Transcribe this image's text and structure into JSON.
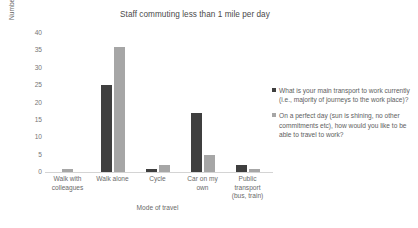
{
  "chart_data": {
    "type": "bar",
    "title": "Staff commuting less than 1 mile per day",
    "xlabel": "Mode of travel",
    "ylabel": "Number of staff",
    "ylim": [
      0,
      40
    ],
    "yticks": [
      40,
      35,
      30,
      25,
      20,
      15,
      10,
      5,
      0
    ],
    "grid": false,
    "legend_position": "right",
    "categories": [
      "Walk with colleagues",
      "Walk alone",
      "Cycle",
      "Car on my own",
      "Public transport (bus, train)"
    ],
    "category_lines": [
      [
        "Walk with",
        "colleagues"
      ],
      [
        "Walk alone"
      ],
      [
        "Cycle"
      ],
      [
        "Car on my",
        "own"
      ],
      [
        "Public",
        "transport",
        "(bus, train)"
      ]
    ],
    "series": [
      {
        "name": "What is your main transport to work currently (i.e., majority of journeys to the work place)?",
        "color": "#3f3f3f",
        "values": [
          0,
          25,
          1,
          17,
          2
        ]
      },
      {
        "name": "On a perfect day (sun is shining, no other commitments etc), how would you like to be able to travel to work?",
        "color": "#a6a6a6",
        "values": [
          1,
          36,
          2,
          5,
          1
        ]
      }
    ]
  },
  "colors": {
    "series_dark": "#3f3f3f",
    "series_light": "#a6a6a6",
    "axis_line": "#d4d4d4",
    "text": "#5e5e5e",
    "background": "#ffffff"
  }
}
